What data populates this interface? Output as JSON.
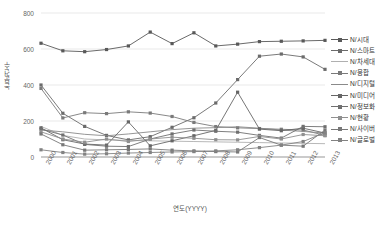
{
  "chart_data": {
    "type": "line",
    "title": "",
    "xlabel": "연도(YYYY)",
    "ylabel": "논문건수",
    "categories": [
      "2000",
      "2001",
      "2002",
      "2003",
      "2004",
      "2005",
      "2006",
      "2007",
      "2008",
      "2009",
      "2010",
      "2011",
      "2012",
      "2013"
    ],
    "ylim": [
      0,
      800
    ],
    "yticks": [
      0,
      200,
      400,
      600,
      800
    ],
    "grid": true,
    "legend_position": "right",
    "series": [
      {
        "name": "N/시대",
        "color": "#595959",
        "marker": "square",
        "values": [
          632,
          590,
          585,
          597,
          617,
          694,
          630,
          690,
          617,
          627,
          641,
          643,
          645,
          648
        ]
      },
      {
        "name": "N/스마트",
        "color": "#6b6b6b",
        "marker": "square",
        "values": [
          400,
          243,
          170,
          120,
          95,
          113,
          165,
          218,
          300,
          430,
          560,
          572,
          556,
          487
        ]
      },
      {
        "name": "N/차세대",
        "color": "#b0b0b0",
        "marker": "none",
        "values": [
          170,
          120,
          100,
          95,
          92,
          90,
          88,
          86,
          84,
          82,
          80,
          78,
          76,
          74
        ]
      },
      {
        "name": "N/융합",
        "color": "#7a7a7a",
        "marker": "square",
        "values": [
          381,
          217,
          246,
          241,
          251,
          244,
          225,
          192,
          169,
          162,
          158,
          154,
          150,
          120
        ]
      },
      {
        "name": "N/디지털",
        "color": "#8a8a8a",
        "marker": "none",
        "values": [
          150,
          140,
          126,
          118,
          128,
          140,
          152,
          160,
          163,
          168,
          160,
          150,
          142,
          133
        ]
      },
      {
        "name": "N/미디어",
        "color": "#666666",
        "marker": "square",
        "values": [
          162,
          96,
          72,
          66,
          195,
          62,
          90,
          118,
          148,
          360,
          155,
          146,
          160,
          133
        ]
      },
      {
        "name": "N/정보화",
        "color": "#707070",
        "marker": "square",
        "values": [
          155,
          122,
          70,
          60,
          58,
          100,
          128,
          150,
          143,
          138,
          120,
          105,
          170,
          168
        ]
      },
      {
        "name": "N/현황",
        "color": "#909090",
        "marker": "square",
        "values": [
          140,
          100,
          82,
          100,
          86,
          100,
          110,
          104,
          96,
          95,
          114,
          100,
          125,
          118
        ]
      },
      {
        "name": "N/사이버",
        "color": "#787878",
        "marker": "square",
        "values": [
          128,
          68,
          38,
          40,
          42,
          45,
          38,
          34,
          30,
          28,
          108,
          66,
          60,
          150
        ]
      },
      {
        "name": "N/글로벌",
        "color": "#828282",
        "marker": "square",
        "values": [
          40,
          25,
          16,
          18,
          22,
          25,
          28,
          30,
          34,
          40,
          52,
          66,
          86,
          136
        ]
      }
    ]
  }
}
